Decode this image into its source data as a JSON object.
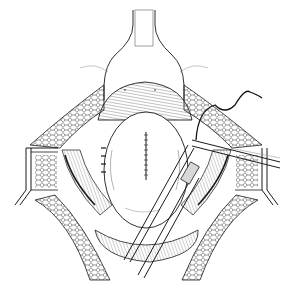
{
  "figure": {
    "kind": "surgical line illustration",
    "colors": {
      "ink": "#1a1a1a",
      "paper": "#ffffff",
      "shade": "#d8d8d8"
    },
    "elements": [
      "upper-retractor-blade",
      "dome-structure",
      "central-organ-with-suture-line",
      "left-retractor",
      "right-retractor",
      "left-tissue-flap",
      "right-tissue-flap",
      "suture-thread",
      "forceps-instrument",
      "needle-holder",
      "lower-tissue-mass"
    ]
  }
}
